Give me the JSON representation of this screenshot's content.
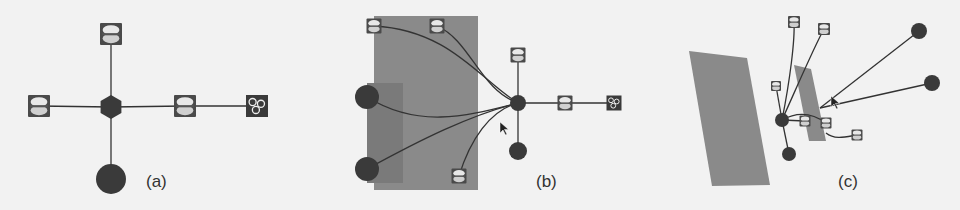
{
  "figure": {
    "background": "#f2f2f2",
    "colors": {
      "edge": "#333333",
      "node_dark": "#3a3a3a",
      "panel_gray": "#8a8a8a",
      "panel_inner": "#7a7a7a",
      "icon_bg": "#4a4a4a",
      "icon_light": "#e8e8e8"
    },
    "panels": [
      {
        "label": "(a)",
        "label_pos": [
          146,
          182
        ],
        "rects": [],
        "hub": {
          "shape": "hexagon",
          "x": 111,
          "y": 107,
          "r": 12
        },
        "nodes": [
          {
            "id": "a1",
            "type": "disk-icon",
            "x": 111,
            "y": 34,
            "s": 22
          },
          {
            "id": "a2",
            "type": "disk-icon",
            "x": 39,
            "y": 106,
            "s": 22
          },
          {
            "id": "a3",
            "type": "disk-icon",
            "x": 185,
            "y": 106,
            "s": 22
          },
          {
            "id": "a4",
            "type": "group-icon",
            "x": 257,
            "y": 106,
            "s": 22
          },
          {
            "id": "a5",
            "type": "circle",
            "x": 111,
            "y": 179,
            "r": 15
          }
        ],
        "edges": [
          {
            "from": [
              111,
              107
            ],
            "to": [
              111,
              34
            ]
          },
          {
            "from": [
              111,
              107
            ],
            "to": [
              39,
              106
            ]
          },
          {
            "from": [
              111,
              107
            ],
            "to": [
              185,
              106
            ]
          },
          {
            "from": [
              185,
              106
            ],
            "to": [
              257,
              106
            ]
          },
          {
            "from": [
              111,
              107
            ],
            "to": [
              111,
              179
            ]
          }
        ]
      },
      {
        "label": "(b)",
        "label_pos": [
          536,
          182
        ],
        "rects": [
          {
            "x": 374,
            "y": 16,
            "w": 104,
            "h": 174,
            "fill": "#8a8a8a"
          },
          {
            "x": 367,
            "y": 83,
            "w": 36,
            "h": 100,
            "fill": "#7a7a7a"
          }
        ],
        "hub": {
          "shape": "circle",
          "x": 518,
          "y": 103,
          "r": 8
        },
        "nodes": [
          {
            "id": "b1",
            "type": "disk-icon",
            "x": 374,
            "y": 26,
            "s": 15
          },
          {
            "id": "b2",
            "type": "disk-icon",
            "x": 437,
            "y": 26,
            "s": 15
          },
          {
            "id": "b3",
            "type": "circle",
            "x": 367,
            "y": 97,
            "r": 12
          },
          {
            "id": "b4",
            "type": "circle",
            "x": 367,
            "y": 169,
            "r": 12
          },
          {
            "id": "b5",
            "type": "disk-icon",
            "x": 459,
            "y": 176,
            "s": 15
          },
          {
            "id": "b6",
            "type": "disk-icon",
            "x": 518,
            "y": 55,
            "s": 15
          },
          {
            "id": "b7",
            "type": "disk-icon",
            "x": 565,
            "y": 103,
            "s": 15
          },
          {
            "id": "b8",
            "type": "group-icon",
            "x": 614,
            "y": 103,
            "s": 15
          },
          {
            "id": "b9",
            "type": "circle",
            "x": 518,
            "y": 151,
            "r": 9
          }
        ],
        "edges": [
          {
            "path": "M374 26 C450 30, 480 80, 518 103"
          },
          {
            "path": "M437 26 C470 40, 480 90, 518 103"
          },
          {
            "path": "M367 97 C420 130, 470 115, 518 103"
          },
          {
            "path": "M367 169 C420 140, 470 115, 518 103"
          },
          {
            "path": "M459 176 C470 140, 490 110, 518 103"
          },
          {
            "path": "M518 103 L518 55"
          },
          {
            "path": "M518 103 L614 103"
          },
          {
            "path": "M518 103 L518 151"
          }
        ],
        "cursor": {
          "x": 500,
          "y": 122
        }
      },
      {
        "label": "(c)",
        "label_pos": [
          838,
          182
        ],
        "rects": [],
        "polys": [
          {
            "points": "689,51 747,58 770,185 712,186",
            "fill": "#8a8a8a"
          },
          {
            "points": "794,65 811,69 826,141 809,141",
            "fill": "#8a8a8a"
          }
        ],
        "hub": {
          "shape": "circle",
          "x": 782,
          "y": 120,
          "r": 7
        },
        "nodes": [
          {
            "id": "c1",
            "type": "disk-icon",
            "x": 794,
            "y": 22,
            "s": 12
          },
          {
            "id": "c2",
            "type": "disk-icon",
            "x": 824,
            "y": 29,
            "s": 12
          },
          {
            "id": "c3",
            "type": "circle",
            "x": 919,
            "y": 31,
            "r": 8
          },
          {
            "id": "c4",
            "type": "circle",
            "x": 932,
            "y": 83,
            "r": 8
          },
          {
            "id": "c5",
            "type": "disk-icon",
            "x": 776,
            "y": 86,
            "s": 10
          },
          {
            "id": "c6",
            "type": "disk-icon",
            "x": 805,
            "y": 121,
            "s": 11
          },
          {
            "id": "c7",
            "type": "disk-icon",
            "x": 826,
            "y": 123,
            "s": 11
          },
          {
            "id": "c8",
            "type": "disk-icon",
            "x": 857,
            "y": 135,
            "s": 11
          },
          {
            "id": "c9",
            "type": "circle",
            "x": 789,
            "y": 154,
            "r": 7
          }
        ],
        "edges": [
          {
            "path": "M782 120 C790 80, 795 40, 794 22"
          },
          {
            "path": "M782 120 C800 80, 815 45, 824 29"
          },
          {
            "path": "M782 120 L776 86"
          },
          {
            "path": "M782 120 L789 154"
          },
          {
            "path": "M782 120 L805 121"
          },
          {
            "path": "M782 120 C800 110, 815 115, 826 123"
          },
          {
            "path": "M820 108 L919 31"
          },
          {
            "path": "M820 108 L932 83"
          },
          {
            "path": "M826 133 C835 140, 845 137, 857 135"
          }
        ],
        "cursor": {
          "x": 831,
          "y": 96
        }
      }
    ]
  }
}
